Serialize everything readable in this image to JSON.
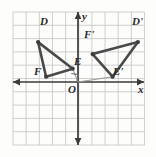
{
  "figure": {
    "type": "coordinate-geometry-diagram",
    "background_color": "#fdfdfc",
    "grid_color": "#c9c9c9",
    "axis_color": "#3a3a3a",
    "shape_color": "#4a4a4a",
    "ray_color": "#9a9a9a"
  },
  "axes": {
    "x_label": "x",
    "y_label": "y",
    "origin_label": "O",
    "x_range": [
      -5,
      5
    ],
    "y_range": [
      -5,
      5
    ],
    "grid": true,
    "grid_columns": 10,
    "grid_rows": 10
  },
  "chart_data": {
    "type": "scatter",
    "xlabel": "x",
    "ylabel": "y",
    "xlim": [
      -5,
      5
    ],
    "ylim": [
      -5,
      5
    ],
    "grid": true,
    "series": [
      {
        "name": "Triangle DEF",
        "points": [
          {
            "label": "D",
            "x": -3.0,
            "y": 3.0
          },
          {
            "label": "E",
            "x": -0.4,
            "y": 1.0
          },
          {
            "label": "F",
            "x": -2.4,
            "y": 0.4
          }
        ],
        "closed": true
      },
      {
        "name": "Triangle D'E'F'",
        "points": [
          {
            "label": "D'",
            "x": 4.5,
            "y": 3.0
          },
          {
            "label": "F'",
            "x": 1.1,
            "y": 2.1
          },
          {
            "label": "E'",
            "x": 2.6,
            "y": 0.4
          }
        ],
        "closed": true
      }
    ],
    "rays": [
      {
        "name": "ray-O-to-E",
        "from": [
          0,
          0
        ],
        "to": [
          -0.4,
          1.0
        ]
      },
      {
        "name": "ray-O-to-E-prime",
        "from": [
          0,
          0
        ],
        "to": [
          2.6,
          0.4
        ]
      }
    ],
    "annotations": [
      {
        "name": "right-angle-marker",
        "at": [
          0,
          0
        ],
        "text": "right angle between OE and OE'"
      }
    ]
  },
  "labels": {
    "D": "D",
    "E": "E",
    "F": "F",
    "D_prime": "D'",
    "E_prime": "E'",
    "F_prime": "F'",
    "origin": "O",
    "x_axis": "x",
    "y_axis": "y"
  }
}
